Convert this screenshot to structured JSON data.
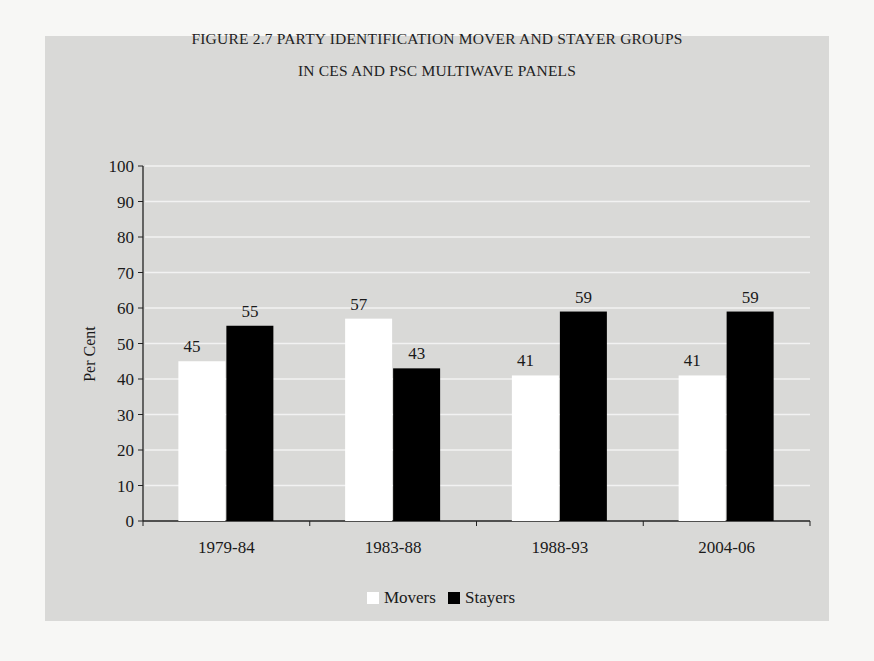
{
  "figure": {
    "title_line1": "FIGURE 2.7 PARTY IDENTIFICATION MOVER AND STAYER GROUPS",
    "title_line2": "IN CES AND PSC MULTIWAVE PANELS"
  },
  "colors": {
    "panel_bg": "#d9d9d7",
    "movers": "#ffffff",
    "stayers": "#000000",
    "gridline": "#f2f2f2"
  },
  "legend": {
    "movers_label": "Movers",
    "stayers_label": "Stayers"
  },
  "chart_data": {
    "type": "bar",
    "categories": [
      "1979-84",
      "1983-88",
      "1988-93",
      "2004-06"
    ],
    "series": [
      {
        "name": "Movers",
        "values": [
          45,
          57,
          41,
          41
        ],
        "color": "#ffffff"
      },
      {
        "name": "Stayers",
        "values": [
          55,
          43,
          59,
          59
        ],
        "color": "#000000"
      }
    ],
    "xlabel": "",
    "ylabel": "Per Cent",
    "ylim": [
      0,
      100
    ],
    "yticks": [
      0,
      10,
      20,
      30,
      40,
      50,
      60,
      70,
      80,
      90,
      100
    ],
    "grid": true,
    "data_labels": true,
    "legend_position": "bottom"
  }
}
